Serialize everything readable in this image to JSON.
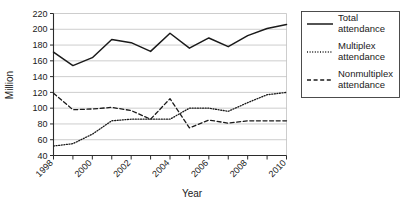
{
  "chart_data": {
    "type": "line",
    "title": "",
    "xlabel": "Year",
    "ylabel": "Million",
    "xlim": [
      1998,
      2010
    ],
    "ylim": [
      40,
      220
    ],
    "ytick_step": 20,
    "grid": true,
    "legend_position": "right",
    "x": [
      1998,
      1999,
      2000,
      2001,
      2002,
      2003,
      2004,
      2005,
      2006,
      2007,
      2008,
      2009,
      2010
    ],
    "xtick_labels": [
      "1998",
      "2000",
      "2002",
      "2004",
      "2006",
      "2008",
      "2010"
    ],
    "xtick_values": [
      1998,
      2000,
      2002,
      2004,
      2006,
      2008,
      2010
    ],
    "xminor_tick_values": [
      1999,
      2001,
      2003,
      2005,
      2007,
      2009
    ],
    "ytick_labels": [
      "40",
      "60",
      "80",
      "100",
      "120",
      "140",
      "160",
      "180",
      "200",
      "220"
    ],
    "ytick_values": [
      40,
      60,
      80,
      100,
      120,
      140,
      160,
      180,
      200,
      220
    ],
    "series": [
      {
        "name": "Total attendance",
        "style": "solid",
        "color": "#1a1a1a",
        "values": [
          171,
          154,
          164,
          187,
          183,
          172,
          195,
          176,
          189,
          178,
          192,
          201,
          206
        ]
      },
      {
        "name": "Multiplex attendance",
        "style": "dotted",
        "color": "#1a1a1a",
        "values": [
          52,
          55,
          67,
          84,
          86,
          86,
          86,
          100,
          100,
          96,
          107,
          117,
          120
        ]
      },
      {
        "name": "Nonmultiplex attendance",
        "style": "dashed",
        "color": "#1a1a1a",
        "values": [
          119,
          98,
          99,
          101,
          97,
          86,
          112,
          75,
          85,
          81,
          84,
          84,
          84
        ]
      }
    ]
  },
  "legend": {
    "entries": [
      {
        "label_line1": "Total",
        "label_line2": "attendance",
        "swatch": "solid-line-swatch"
      },
      {
        "label_line1": "Multiplex",
        "label_line2": "attendance",
        "swatch": "dotted-line-swatch"
      },
      {
        "label_line1": "Nonmultiplex",
        "label_line2": "attendance",
        "swatch": "dashed-line-swatch"
      }
    ]
  }
}
